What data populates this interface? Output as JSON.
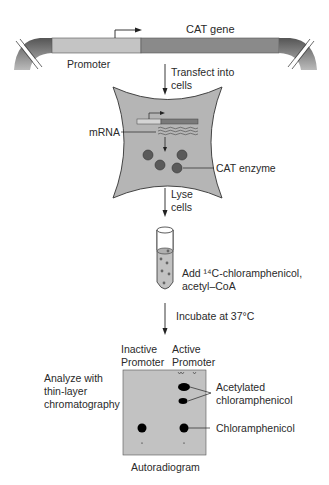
{
  "plasmid": {
    "gene_label": "CAT gene",
    "promoter_label": "Promoter",
    "colors": {
      "promoter": "#c4c4c4",
      "gene": "#8a8a8a",
      "backbone": "#6a6a6a"
    }
  },
  "steps": {
    "transfect": [
      "Transfect into",
      "cells"
    ],
    "lyse": [
      "Lyse",
      "cells"
    ],
    "add": [
      "Add ¹⁴C-chloramphenicol,",
      "acetyl–CoA"
    ],
    "incubate": "Incubate at 37°C",
    "analyze": [
      "Analyze with",
      "thin-layer",
      "chromatography"
    ]
  },
  "cell": {
    "mrna_label": "mRNA",
    "enzyme_label": "CAT enzyme",
    "fill": "#b5b5b5"
  },
  "tlc": {
    "lane_inactive": [
      "Inactive",
      "Promoter"
    ],
    "lane_active": [
      "Active",
      "Promoter"
    ],
    "acetylated_label": [
      "Acetylated",
      "chloramphenicol"
    ],
    "chloramphenicol_label": "Chloramphenicol",
    "caption": "Autoradiogram",
    "plate_fill": "#c2c2c2"
  }
}
